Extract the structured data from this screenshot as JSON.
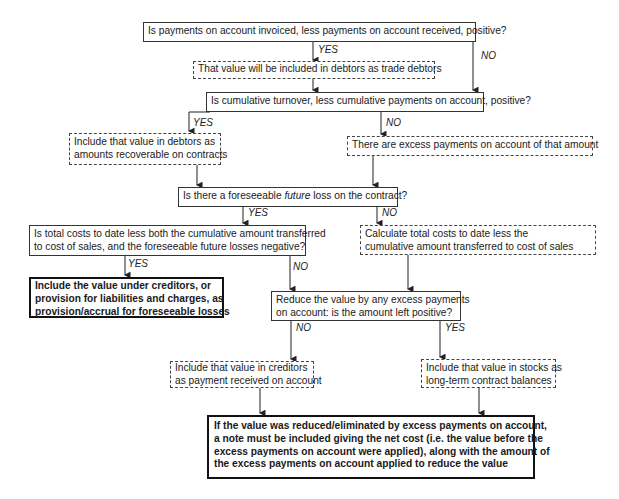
{
  "diagram": {
    "nodes": {
      "q_invoiced": {
        "text": "Is payments on account invoiced, less payments on account received, positive?",
        "style": "decision"
      },
      "trade_debtors": {
        "text": "That value will be included in debtors as trade debtors",
        "style": "action-dashed"
      },
      "q_turnover": {
        "text": "Is cumulative turnover, less cumulative payments on account, positive?",
        "style": "decision"
      },
      "recoverable": {
        "line1": "Include that value in debtors as",
        "line2": "amounts recoverable on contracts",
        "style": "action-dashed"
      },
      "excess": {
        "text": "There are excess payments on account of that amount",
        "style": "action-dashed"
      },
      "q_future_loss": {
        "pre": "Is there a foreseeable ",
        "em": "future",
        "post": " loss on the contract?",
        "style": "decision"
      },
      "q_total_costs": {
        "line1": "Is total costs to date less both the cumulative amount transferred",
        "line2": "to cost of sales, and the foreseeable future losses negative?",
        "style": "decision"
      },
      "calc_costs": {
        "line1": "Calculate total costs to date less the",
        "line2": "cumulative amount transferred to cost of sales",
        "style": "action-dashed"
      },
      "creditors_provision": {
        "line1": "Include the value under creditors, or",
        "line2": "provision for liabilities and charges, as",
        "line3": "provision/accrual for foreseeable losses",
        "style": "terminal-bold"
      },
      "q_reduce": {
        "line1": "Reduce the value by any excess payments",
        "line2": "on account: is the amount left positive?",
        "style": "decision"
      },
      "creditors_payment": {
        "line1": "Include that value in creditors",
        "line2": "as payment received on account",
        "style": "action-dashed"
      },
      "stocks": {
        "line1": "Include that value in stocks as",
        "line2": "long-term contract balances",
        "style": "action-dashed"
      },
      "note": {
        "line1": "If the value was reduced/eliminated by excess payments on account,",
        "line2": "a note must be included giving the net cost (i.e. the value before the",
        "line3": "excess payments on account were applied), along with the amount of",
        "line4": "the excess payments on account applied to reduce the value",
        "style": "terminal-bold"
      }
    },
    "edge_labels": {
      "yes": "YES",
      "no": "NO"
    }
  }
}
